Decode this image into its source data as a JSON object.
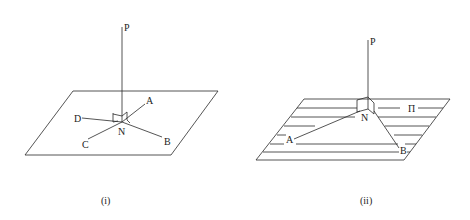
{
  "figure_i": {
    "caption": "(i)",
    "labels": {
      "P": "P",
      "N": "N",
      "A": "A",
      "B": "B",
      "C": "C",
      "D": "D"
    }
  },
  "figure_ii": {
    "caption": "(ii)",
    "labels": {
      "P": "P",
      "N": "N",
      "A": "A",
      "B": "B",
      "plane": "Π"
    }
  },
  "colors": {
    "stroke": "#2a2a2a",
    "background": "#ffffff"
  }
}
